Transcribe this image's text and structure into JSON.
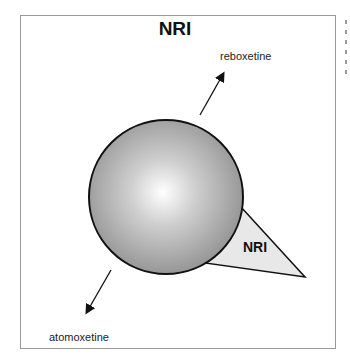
{
  "title": "NRI",
  "arrows": {
    "up_label": "reboxetine",
    "down_label": "atomoxetine"
  },
  "triangle_label": "NRI",
  "colors": {
    "frame": "#999999",
    "sphere_light": "#ffffff",
    "sphere_dark": "#8a8a8a",
    "triangle_fill": "#e8e8e8",
    "stroke": "#111111"
  }
}
